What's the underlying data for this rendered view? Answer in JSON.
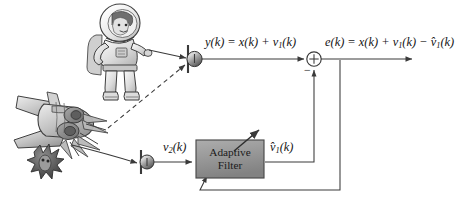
{
  "diagram": {
    "background_color": "#ffffff",
    "line_color": "#3a3a3a",
    "text_color": "#151515",
    "signals": {
      "primary_label_lhs": "y(k)",
      "primary_label_rhs": " = x(k) + v",
      "primary_sub": "1",
      "primary_tail": "(k)",
      "reference_label": "v",
      "reference_sub": "2",
      "reference_tail": "(k)",
      "filter_output_label": "v̂",
      "filter_output_sub": "1",
      "filter_output_tail": "(k)",
      "error_label": "e(k)",
      "error_rhs_a": " = x(k) + v",
      "error_sub_a": "1",
      "error_mid": "(k) − v̂",
      "error_sub_b": "1",
      "error_tail": "(k)"
    },
    "blocks": [
      {
        "name": "adaptive-filter",
        "line1": "Adaptive",
        "line2": "Filter",
        "fill": "#9a9a9a",
        "stroke": "#4a4a4a"
      }
    ],
    "junctions": [
      {
        "name": "summing-junction",
        "operator": "⊕",
        "negative_input_sign": "−"
      }
    ],
    "sensors": [
      {
        "name": "primary-microphone",
        "index": "1"
      },
      {
        "name": "reference-microphone",
        "index": "2"
      }
    ],
    "sources": [
      {
        "name": "astronaut-speaker",
        "kind": "signal-source"
      },
      {
        "name": "jet-noise-source",
        "kind": "noise-source"
      },
      {
        "name": "alien-creature",
        "kind": "decorative"
      }
    ],
    "paths": [
      {
        "name": "speech-to-primary-mic",
        "style": "solid-arrow"
      },
      {
        "name": "noise-to-primary-mic",
        "style": "dashed-arrow"
      },
      {
        "name": "noise-to-reference-mic",
        "style": "solid-arrow"
      },
      {
        "name": "primary-mic-to-summer",
        "style": "solid-arrow"
      },
      {
        "name": "reference-mic-to-filter",
        "style": "solid-arrow"
      },
      {
        "name": "filter-to-summer-negative",
        "style": "solid-arrow"
      },
      {
        "name": "summer-to-error-output",
        "style": "solid-arrow"
      },
      {
        "name": "error-feedback-to-filter",
        "style": "solid-arrow"
      },
      {
        "name": "filter-adaptation-arrow",
        "style": "diagonal-arrow"
      }
    ]
  }
}
